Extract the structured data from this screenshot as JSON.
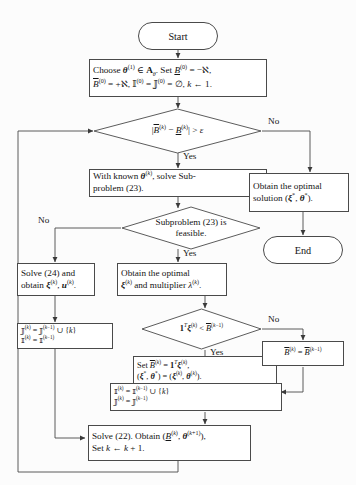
{
  "diagram": {
    "type": "flowchart",
    "background_color": "#fcfcfc",
    "stroke_color": "#4a4a4a",
    "text_color": "#141414",
    "nodes": [
      {
        "id": "start",
        "shape": "terminal",
        "text": "Start"
      },
      {
        "id": "init",
        "shape": "process",
        "text": "Choose θ(1) ∈ Aθ. Set B(0) = −ℵ, B̄(0) = +ℵ, ℐ(0) = ℑ(0) = ∅, k ← 1.",
        "line1": "Choose θ(1) ∈ Aθ. Set B(0) = −ℵ,",
        "line2": "B̄(0) = +ℵ, ℐ(0) = ℑ(0) = ∅, k ← 1."
      },
      {
        "id": "gap_check",
        "shape": "decision",
        "text": "|B̄(k) − B(k)| > ε"
      },
      {
        "id": "solve_sub",
        "shape": "process",
        "line1": "With known θ(k), solve Sub-",
        "line2": "problem (23)."
      },
      {
        "id": "optimal_solution",
        "shape": "process",
        "line1": "Obtain the optimal",
        "line2": "solution (ξ*, θ*)."
      },
      {
        "id": "end",
        "shape": "terminal",
        "text": "End"
      },
      {
        "id": "feasible_check",
        "shape": "decision",
        "line1": "Subproblem (23) is",
        "line2": "feasible."
      },
      {
        "id": "solve24",
        "shape": "process",
        "line1": "Solve (24) and",
        "line2": "obtain ξ(k), u(k)."
      },
      {
        "id": "obtain_multiplier",
        "shape": "process",
        "line1": "Obtain the optimal",
        "line2": "ξ(k) and multiplier λ(k)."
      },
      {
        "id": "bound_check",
        "shape": "decision",
        "text": "1Tξ(k) < B̄(k−1)"
      },
      {
        "id": "update_J",
        "shape": "process",
        "line1": "ℑ(k) = ℑ(k−1) ∪ {k}",
        "line2": "ℐ(k) = ℐ(k−1)"
      },
      {
        "id": "set_upper",
        "shape": "process",
        "line1": "Set B̄(k) = 1Tξ(k),",
        "line2": "(ξ*, θ*) = (ξ(k), θ(k))."
      },
      {
        "id": "keep_upper",
        "shape": "process",
        "text": "B̄(k) = B̄(k−1)"
      },
      {
        "id": "update_I",
        "shape": "process",
        "line1": "ℐ(k) = ℐ(k−1) ∪ {k}",
        "line2": "ℑ(k) = ℑ(k−1)"
      },
      {
        "id": "solve22",
        "shape": "process",
        "line1": "Solve (22). Obtain (B(k), θ(k+1)),",
        "line2": "Set k ← k + 1."
      }
    ],
    "edge_labels": {
      "gap_no": "No",
      "gap_yes": "Yes",
      "feasible_no": "No",
      "feasible_yes": "Yes",
      "bound_no": "No",
      "bound_yes": "Yes"
    }
  }
}
